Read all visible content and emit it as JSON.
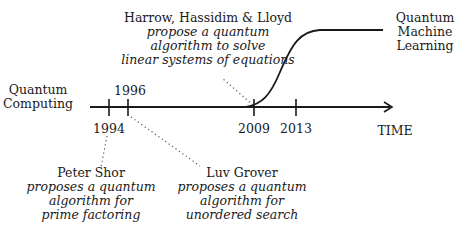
{
  "diagram": {
    "type": "timeline",
    "axis_label": "TIME",
    "start_label": [
      "Quantum",
      "Computing"
    ],
    "end_label": [
      "Quantum",
      "Machine",
      "Learning"
    ],
    "ticks": [
      {
        "year": "1994",
        "x": 109,
        "label_pos": "below"
      },
      {
        "year": "1996",
        "x": 128,
        "label_pos": "above"
      },
      {
        "year": "2009",
        "x": 254,
        "label_pos": "below"
      },
      {
        "year": "2013",
        "x": 296,
        "label_pos": "below"
      }
    ],
    "events": [
      {
        "year": "2009",
        "title": "Harrow, Hassidim & Lloyd",
        "lines": [
          "propose a quantum",
          "algorithm to solve",
          "linear systems of equations"
        ]
      },
      {
        "year": "1994",
        "title": "Peter Shor",
        "lines": [
          "proposes a quantum",
          "algorithm for",
          "prime factoring"
        ]
      },
      {
        "year": "1996",
        "title": "Luv Grover",
        "lines": [
          "proposes a quantum",
          "algorithm for",
          "unordered search"
        ]
      }
    ]
  }
}
